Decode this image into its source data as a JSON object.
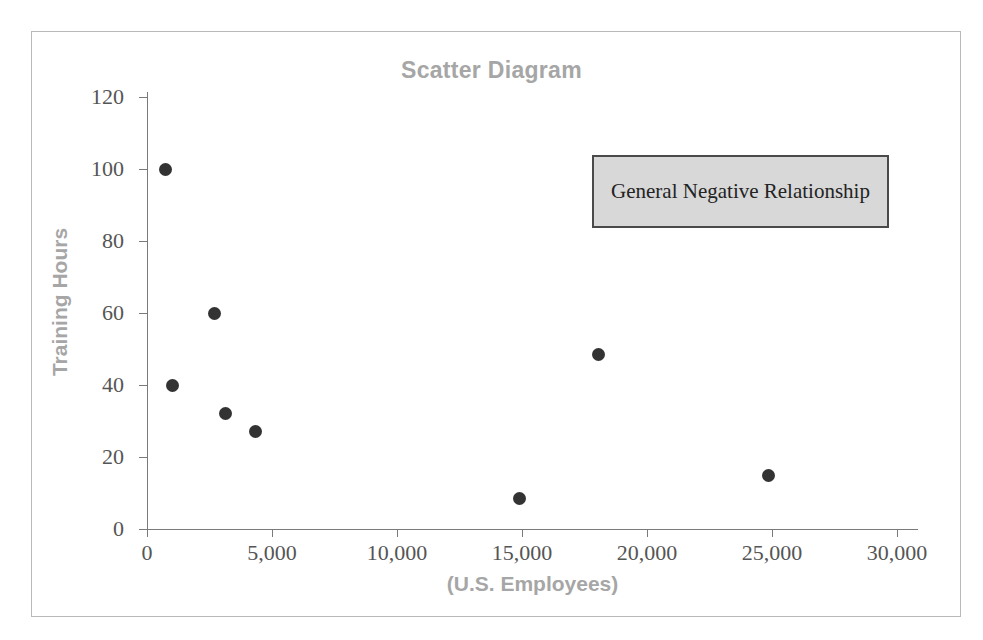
{
  "chart_data": {
    "type": "scatter",
    "title": "Scatter Diagram",
    "xlabel": "(U.S. Employees)",
    "ylabel": "Training Hours",
    "xlim": [
      0,
      30000
    ],
    "ylim": [
      0,
      120
    ],
    "grid": false,
    "legend": null,
    "x_ticks": [
      0,
      5000,
      10000,
      15000,
      20000,
      25000,
      30000
    ],
    "x_tick_labels": [
      "0",
      "5,000",
      "10,000",
      "15,000",
      "20,000",
      "25,000",
      "30,000"
    ],
    "y_ticks": [
      0,
      20,
      40,
      60,
      80,
      100,
      120
    ],
    "y_tick_labels": [
      "0",
      "20",
      "40",
      "60",
      "80",
      "100",
      "120"
    ],
    "points": [
      {
        "x": 720,
        "y": 100
      },
      {
        "x": 1000,
        "y": 40
      },
      {
        "x": 2680,
        "y": 60
      },
      {
        "x": 3120,
        "y": 32
      },
      {
        "x": 4320,
        "y": 27
      },
      {
        "x": 14900,
        "y": 8.5
      },
      {
        "x": 18050,
        "y": 48.5
      },
      {
        "x": 24840,
        "y": 15
      }
    ],
    "annotations": [
      {
        "text": "General Negative Relationship"
      }
    ],
    "marker_color": "#333333",
    "title_color": "#a6a6a6",
    "axis_color": "#7a7a7a",
    "annotation_fill": "#d8d8d8",
    "annotation_border": "#4a4a4a"
  }
}
